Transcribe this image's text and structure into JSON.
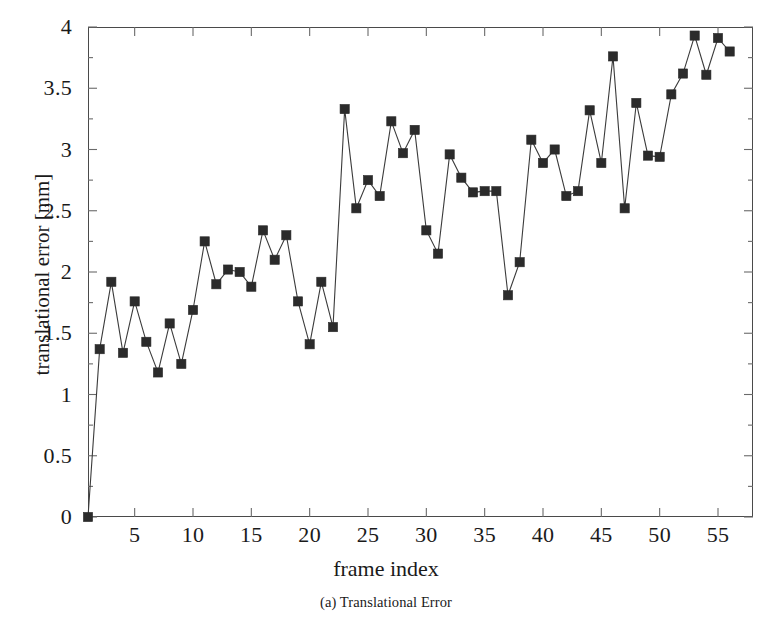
{
  "figure": {
    "caption": "(a) Translational Error"
  },
  "chart_data": {
    "type": "line",
    "title": "",
    "subtitle": "",
    "xlabel": "frame index",
    "ylabel": "translational error [mm]",
    "xlim": [
      1,
      58
    ],
    "ylim": [
      0,
      4
    ],
    "grid": false,
    "legend": null,
    "marker": "filled-square",
    "x_ticks": [
      5,
      10,
      15,
      20,
      25,
      30,
      35,
      40,
      45,
      50,
      55
    ],
    "x_tick_labels": [
      "5",
      "10",
      "15",
      "20",
      "25",
      "30",
      "35",
      "40",
      "45",
      "50",
      "55"
    ],
    "y_ticks": [
      0,
      0.5,
      1,
      1.5,
      2,
      2.5,
      3,
      3.5,
      4
    ],
    "y_tick_labels": [
      "0",
      "0.5",
      "1",
      "1.5",
      "2",
      "2.5",
      "3",
      "3.5",
      "4"
    ],
    "y_minor_step": 0.25,
    "x": [
      1,
      2,
      3,
      4,
      5,
      6,
      7,
      8,
      9,
      10,
      11,
      12,
      13,
      14,
      15,
      16,
      17,
      18,
      19,
      20,
      21,
      22,
      23,
      24,
      25,
      26,
      27,
      28,
      29,
      30,
      31,
      32,
      33,
      34,
      35,
      36,
      37,
      38,
      39,
      40,
      41,
      42,
      43,
      44,
      45,
      46,
      47,
      48,
      49,
      50,
      51,
      52,
      53,
      54,
      55,
      56
    ],
    "values": [
      0.0,
      1.37,
      1.92,
      1.34,
      1.76,
      1.43,
      1.18,
      1.58,
      1.25,
      1.69,
      2.25,
      1.9,
      2.02,
      2.0,
      1.88,
      2.34,
      2.1,
      2.3,
      1.76,
      1.41,
      1.92,
      1.55,
      3.33,
      2.52,
      2.75,
      2.62,
      3.23,
      2.97,
      3.16,
      2.34,
      2.15,
      2.96,
      2.77,
      2.65,
      2.66,
      2.66,
      1.81,
      2.08,
      3.08,
      2.89,
      3.0,
      2.62,
      2.66,
      3.32,
      2.89,
      3.76,
      2.52,
      3.38,
      2.95,
      2.94,
      3.45,
      3.62,
      3.93,
      3.61,
      3.91,
      3.8
    ],
    "series": [
      {
        "name": "translational error",
        "values": [
          0.0,
          1.37,
          1.92,
          1.34,
          1.76,
          1.43,
          1.18,
          1.58,
          1.25,
          1.69,
          2.25,
          1.9,
          2.02,
          2.0,
          1.88,
          2.34,
          2.1,
          2.3,
          1.76,
          1.41,
          1.92,
          1.55,
          3.33,
          2.52,
          2.75,
          2.62,
          3.23,
          2.97,
          3.16,
          2.34,
          2.15,
          2.96,
          2.77,
          2.65,
          2.66,
          2.66,
          1.81,
          2.08,
          3.08,
          2.89,
          3.0,
          2.62,
          2.66,
          3.32,
          2.89,
          3.76,
          2.52,
          3.38,
          2.95,
          2.94,
          3.45,
          3.62,
          3.93,
          3.61,
          3.91,
          3.8
        ]
      }
    ],
    "colors": {
      "line": "#3b3b3b",
      "marker": "#2b2b2b",
      "axis": "#4a4a4a",
      "background": "#ffffff"
    }
  }
}
